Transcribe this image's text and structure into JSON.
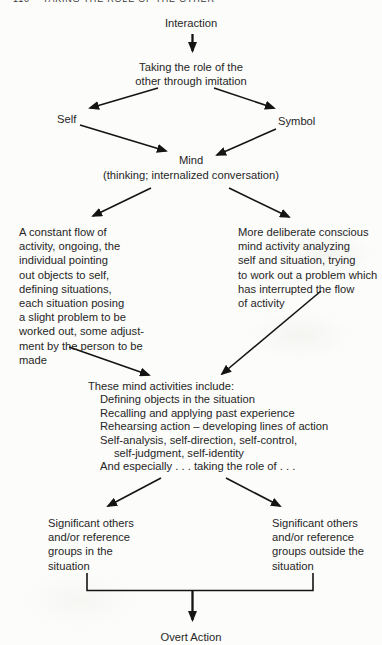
{
  "page": {
    "header": "110    TAKING THE ROLE OF THE OTHER"
  },
  "nodes": {
    "interaction": "Interaction",
    "taking_role": "Taking the role of the\nother through imitation",
    "self": "Self",
    "symbol": "Symbol",
    "mind": "Mind",
    "mind_sub": "(thinking; internalized conversation)",
    "constant_flow": "A constant flow of\nactivity, ongoing, the\nindividual pointing\nout objects to self,\ndefining situations,\neach situation posing\na slight problem to be\nworked out, some adjust-\nment by the person to be\nmade",
    "deliberate": "More deliberate conscious\nmind activity analyzing\nself and situation, trying\nto work out a problem which\nhas interrupted the flow\nof activity",
    "activities": {
      "title": "These mind activities include:",
      "lines": [
        "Defining objects in the situation",
        "Recalling and applying past experience",
        "Rehearsing action – developing lines of action",
        "Self-analysis, self-direction, self-control,",
        "self-judgment, self-identity",
        "And especially . . . taking the role of . . ."
      ]
    },
    "group_in": "Significant others\nand/or reference\ngroups in the\nsituation",
    "group_outside": "Significant others\nand/or reference\ngroups outside the\nsituation",
    "overt_action": "Overt Action"
  },
  "colors": {
    "text": "#262626",
    "arrow": "#141414",
    "background": "#fcfcfa"
  }
}
